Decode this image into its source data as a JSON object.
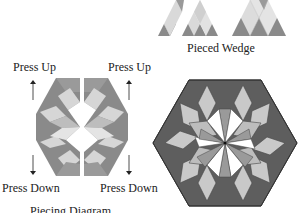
{
  "labels": {
    "pieced_wedge": "Pieced Wedge",
    "press_up_left": "Press Up",
    "press_up_right": "Press Up",
    "press_down_left": "Press Down",
    "press_down_right": "Press Down",
    "piecing_diagram": "Piecing Diagram"
  },
  "colors": {
    "dark": "#6e6e6e",
    "medium": "#9a9a9a",
    "light": "#d6d6d6",
    "white": "#ffffff",
    "outline": "#3a3a3a",
    "text": "#222222"
  }
}
